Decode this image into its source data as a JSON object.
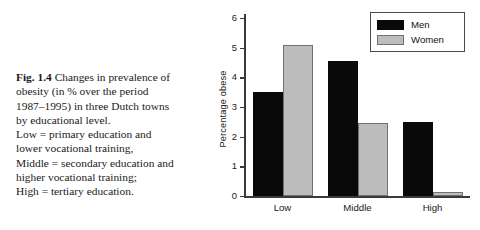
{
  "caption": {
    "figure_label": "Fig. 1.4",
    "lines": [
      "Changes in prevalence of",
      "obesity (in % over the period",
      "1987–1995) in three Dutch towns",
      "by educational level.",
      "Low = primary education and",
      "lower vocational training,",
      "Middle = secondary education and",
      "higher vocational training;",
      "High = tertiary education."
    ]
  },
  "chart_data": {
    "type": "bar",
    "title": "",
    "xlabel": "",
    "ylabel": "Percentage obese",
    "categories": [
      "Low",
      "Middle",
      "High"
    ],
    "series": [
      {
        "name": "Men",
        "color": "#090909",
        "values": [
          3.5,
          4.55,
          2.5
        ]
      },
      {
        "name": "Women",
        "color": "#bcbcbc",
        "values": [
          5.1,
          2.45,
          0.15
        ]
      }
    ],
    "ylim": [
      0,
      6
    ],
    "yticks": [
      0,
      1,
      2,
      3,
      4,
      5,
      6
    ],
    "ytick_labels": [
      "0",
      "1",
      "2",
      "3",
      "4",
      "5",
      "6"
    ],
    "grid": false,
    "legend_position": "top-right"
  },
  "colors": {
    "men": "#090909",
    "women": "#bcbcbc",
    "axis": "#3a3a3a",
    "background": "#ffffff"
  }
}
